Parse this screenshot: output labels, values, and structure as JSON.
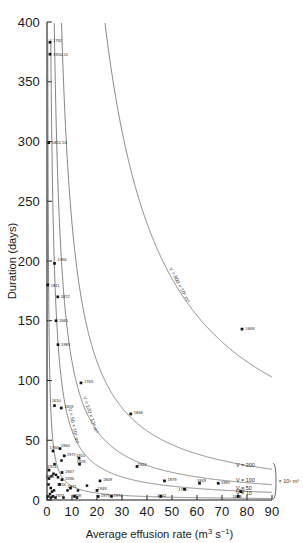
{
  "chart_data": {
    "type": "scatter",
    "title": "",
    "xlabel": "Average effusion rate (m3 s-1)",
    "xlabel_parts": {
      "text": "Average effusion rate (m",
      "sup1": "3",
      "mid": " s",
      "sup2": "−1",
      "close": ")"
    },
    "ylabel": "Duration (days)",
    "xlim": [
      0,
      90
    ],
    "ylim": [
      0,
      400
    ],
    "xticks": [
      0,
      10,
      20,
      30,
      40,
      50,
      60,
      70,
      80,
      90
    ],
    "xticklabels": [
      "0",
      "10",
      "20",
      "30",
      "40",
      "50",
      "60",
      "70",
      "80",
      "90"
    ],
    "yticks": [
      0,
      50,
      100,
      150,
      200,
      250,
      300,
      350,
      400
    ],
    "yticklabels": [
      "0",
      "50",
      "100",
      "150",
      "200",
      "250",
      "300",
      "350",
      "400"
    ],
    "grid": false,
    "legend_position": "none",
    "annotation_units": "× 10⁶ m³",
    "points": [
      {
        "label": "1792",
        "x": 1.2,
        "y": 383,
        "lx": 2.4,
        "ly": 385
      },
      {
        "label": "1950-51",
        "x": 1.2,
        "y": 373,
        "lx": 2.4,
        "ly": 373
      },
      {
        "label": "1852-53",
        "x": 0.7,
        "y": 299,
        "lx": 1.9,
        "ly": 299
      },
      {
        "label": "1766",
        "x": 3.0,
        "y": 198,
        "lx": 4.2,
        "ly": 201
      },
      {
        "label": "1811",
        "x": 0.3,
        "y": 180,
        "lx": 1.5,
        "ly": 180
      },
      {
        "label": "1872",
        "x": 4.3,
        "y": 170,
        "lx": 5.5,
        "ly": 170
      },
      {
        "label": "1865",
        "x": 3.6,
        "y": 150,
        "lx": 4.8,
        "ly": 150
      },
      {
        "label": "1983",
        "x": 4.4,
        "y": 130,
        "lx": 5.6,
        "ly": 130
      },
      {
        "label": "1763",
        "x": 13.6,
        "y": 98,
        "lx": 14.8,
        "ly": 99
      },
      {
        "label": "1610",
        "x": 3.0,
        "y": 79,
        "lx": 1.9,
        "ly": 83
      },
      {
        "label": "1819",
        "x": 5.7,
        "y": 77,
        "lx": 6.9,
        "ly": 78
      },
      {
        "label": "1846",
        "x": 33.5,
        "y": 72,
        "lx": 34.7,
        "ly": 73
      },
      {
        "label": "1766A",
        "x": 2.4,
        "y": 41,
        "lx": 1.0,
        "ly": 44
      },
      {
        "label": "1960",
        "x": 5.2,
        "y": 43,
        "lx": 5.5,
        "ly": 46
      },
      {
        "label": "1971",
        "x": 6.9,
        "y": 37,
        "lx": 7.9,
        "ly": 38
      },
      {
        "label": "1910",
        "x": 12.8,
        "y": 35,
        "lx": 11.6,
        "ly": 37
      },
      {
        "label": "1928",
        "x": 13.0,
        "y": 30,
        "lx": 11.8,
        "ly": 32
      },
      {
        "label": "1923",
        "x": 36.0,
        "y": 28,
        "lx": 36.2,
        "ly": 30
      },
      {
        "label": "1974",
        "x": 0.8,
        "y": 25,
        "lx": 0.2,
        "ly": 28
      },
      {
        "label": "1947",
        "x": 6.0,
        "y": 23,
        "lx": 7.2,
        "ly": 24
      },
      {
        "label": "1971B",
        "x": 0.8,
        "y": 18,
        "lx": -0.6,
        "ly": 20
      },
      {
        "label": "1936",
        "x": 6.0,
        "y": 17,
        "lx": 7.2,
        "ly": 18
      },
      {
        "label": "1934",
        "x": 5.0,
        "y": 13,
        "lx": 3.9,
        "ly": 13
      },
      {
        "label": "1809",
        "x": 21.2,
        "y": 16,
        "lx": 22.4,
        "ly": 17
      },
      {
        "label": "1971C",
        "x": 9.4,
        "y": 10,
        "lx": 8.2,
        "ly": 11
      },
      {
        "label": "1879",
        "x": 47.0,
        "y": 16,
        "lx": 48.2,
        "ly": 17
      },
      {
        "label": "1949",
        "x": 20.0,
        "y": 8,
        "lx": 20.2,
        "ly": 10
      },
      {
        "label": "1874",
        "x": 2.4,
        "y": 3,
        "lx": 3.3,
        "ly": 4
      },
      {
        "label": "1908",
        "x": 11.0,
        "y": 3,
        "lx": 10.0,
        "ly": 4
      },
      {
        "label": "1979",
        "x": 20.5,
        "y": 3,
        "lx": 21.5,
        "ly": 4
      },
      {
        "label": "1974B",
        "x": 25.8,
        "y": 3,
        "lx": 26.6,
        "ly": 4
      },
      {
        "label": "1942",
        "x": 45.5,
        "y": 3,
        "lx": 44.0,
        "ly": 4
      },
      {
        "label": "1780",
        "x": 55.0,
        "y": 9,
        "lx": 52.5,
        "ly": 9
      },
      {
        "label": "1849",
        "x": 61.0,
        "y": 14,
        "lx": 60.0,
        "ly": 16
      },
      {
        "label": "1991",
        "x": 68.5,
        "y": 14,
        "lx": 69.6,
        "ly": 15
      },
      {
        "label": "1766B",
        "x": 77.5,
        "y": 7,
        "lx": 75.5,
        "ly": 8
      },
      {
        "label": "1878",
        "x": 76.5,
        "y": 3,
        "lx": 74.2,
        "ly": 3
      },
      {
        "label": "1669",
        "x": 78.0,
        "y": 143,
        "lx": 79.4,
        "ly": 144
      }
    ],
    "extra_points": [
      {
        "x": 1.5,
        "y": 10
      },
      {
        "x": 2.0,
        "y": 7
      },
      {
        "x": 1.2,
        "y": 5
      },
      {
        "x": 2.8,
        "y": 8
      },
      {
        "x": 0.6,
        "y": 13
      },
      {
        "x": 1.8,
        "y": 20
      },
      {
        "x": 2.6,
        "y": 22
      },
      {
        "x": 3.6,
        "y": 21
      },
      {
        "x": 4.4,
        "y": 19
      },
      {
        "x": 0.5,
        "y": 3
      },
      {
        "x": 1.5,
        "y": 2
      },
      {
        "x": 3.4,
        "y": 2
      },
      {
        "x": 6.6,
        "y": 2
      },
      {
        "x": 12.0,
        "y": 2
      },
      {
        "x": 8.2,
        "y": 8
      },
      {
        "x": 12.4,
        "y": 8
      },
      {
        "x": 16.0,
        "y": 12
      },
      {
        "x": 3.0,
        "y": 30
      },
      {
        "x": 5.8,
        "y": 33
      }
    ],
    "iso_volume_curves": [
      {
        "label": "V = 800",
        "volume": 800,
        "label_text": "V = 800 × 10⁶ m³",
        "label_inline": true
      },
      {
        "label": "V = 200",
        "volume": 200,
        "label_text": "V = 200",
        "label_inline": false
      },
      {
        "label": "V = 100",
        "volume": 100,
        "label_text": "V = 100 × 10⁶ m³",
        "label_inline": true
      },
      {
        "label": "V = 50",
        "volume": 50,
        "label_text": "V = 50 × 10⁶",
        "label_inline": true
      },
      {
        "label": "V = 10",
        "volume": 10,
        "label_text": "V = 10",
        "label_inline": false
      }
    ],
    "right_labels": [
      {
        "text": "V = 200"
      },
      {
        "text": "V = 100"
      },
      {
        "text": "V = 50"
      },
      {
        "text": "V = 10"
      }
    ],
    "curve_inline_labels": [
      {
        "text": "V = 800 × 10⁶ m³"
      },
      {
        "text": "V = 100 × 10⁶ m³"
      },
      {
        "text": "V = 50 × 10⁶ m³"
      }
    ]
  }
}
